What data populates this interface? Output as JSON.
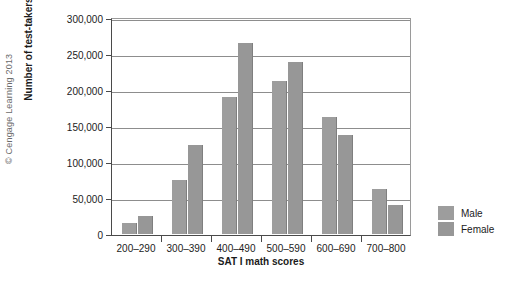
{
  "figure": {
    "copyright": "© Cengage Learning 2013"
  },
  "legend": {
    "position": "right",
    "entries": [
      {
        "label": "Male",
        "color": "#9d9d9d"
      },
      {
        "label": "Female",
        "color": "#979797"
      }
    ]
  },
  "chart_data": {
    "type": "bar",
    "title": "",
    "xlabel": "SAT I math scores",
    "ylabel": "Number of test-takers",
    "categories": [
      "200–290",
      "300–390",
      "400–490",
      "500–590",
      "600–690",
      "700–800"
    ],
    "series": [
      {
        "name": "Male",
        "color": "#9d9d9d",
        "values": [
          15000,
          75000,
          190000,
          212000,
          162000,
          63000
        ]
      },
      {
        "name": "Female",
        "color": "#979797",
        "values": [
          25000,
          123000,
          265000,
          239000,
          138000,
          40000
        ]
      }
    ],
    "ylim": [
      0,
      300000
    ],
    "ytick_values": [
      0,
      50000,
      100000,
      150000,
      200000,
      250000,
      300000
    ],
    "ytick_labels": [
      "0",
      "50,000",
      "100,000",
      "150,000",
      "200,000",
      "250,000",
      "300,000"
    ],
    "grid": true,
    "grid_axis": "y"
  }
}
